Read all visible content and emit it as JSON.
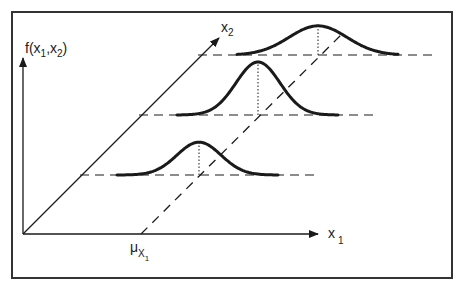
{
  "diagram": {
    "labels": {
      "vertical_axis": "f(x",
      "vertical_axis_sub1": "1",
      "vertical_axis_sep": ",x",
      "vertical_axis_sub2": "2",
      "vertical_axis_close": ")",
      "depth_axis": "x",
      "depth_axis_sub": "2",
      "horizontal_axis": "x",
      "horizontal_axis_sub": "1",
      "mean_marker": "μ",
      "mean_marker_sub": "X",
      "mean_marker_subsub": "1"
    },
    "curves": [
      {
        "name": "low",
        "relative_height": 0.62,
        "spread": "medium"
      },
      {
        "name": "middle",
        "relative_height": 1.0,
        "spread": "medium"
      },
      {
        "name": "high",
        "relative_height": 0.55,
        "spread": "wide"
      }
    ],
    "colors": {
      "stroke": "#1a1a1a",
      "frame": "#333333",
      "background": "#ffffff"
    }
  }
}
